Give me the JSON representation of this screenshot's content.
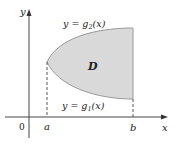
{
  "diagram": {
    "axes": {
      "x_label": "x",
      "y_label": "y",
      "origin_label": "0"
    },
    "points": {
      "a_label": "a",
      "b_label": "b"
    },
    "curves": {
      "upper": {
        "label_prefix": "y = g",
        "subscript": "2",
        "label_suffix": "(x)"
      },
      "lower": {
        "label_prefix": "y = g",
        "subscript": "1",
        "label_suffix": "(x)"
      }
    },
    "region": {
      "label": "D",
      "fill_color": "#d9d9d9",
      "stroke_color": "#9a9a9a"
    },
    "axis_color": "#444444"
  }
}
